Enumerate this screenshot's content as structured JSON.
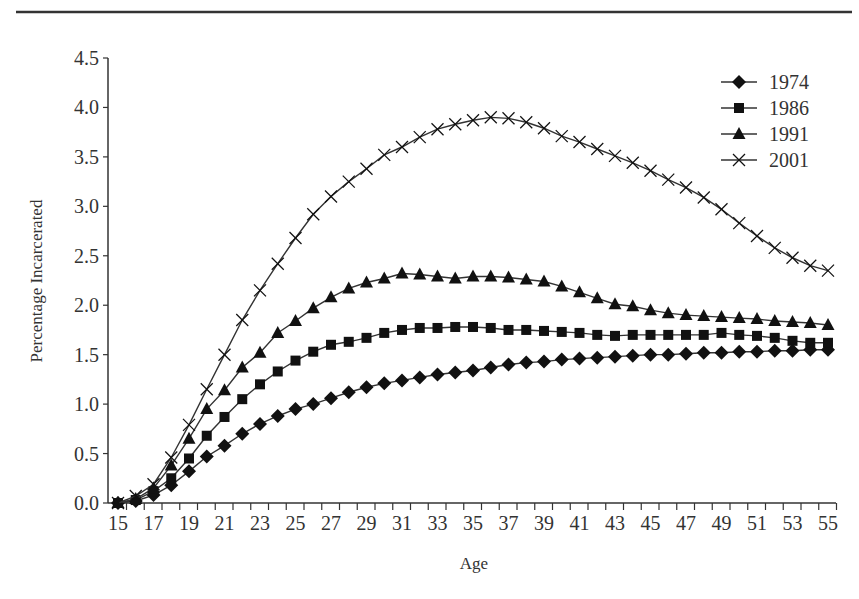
{
  "chart_data": {
    "type": "line",
    "title": "",
    "xlabel": "Age",
    "ylabel": "Percentage Incarcerated",
    "ylim": [
      0,
      4.5
    ],
    "xlim": [
      15,
      55
    ],
    "y_ticks": [
      "0.0",
      "0.5",
      "1.0",
      "1.5",
      "2.0",
      "2.5",
      "3.0",
      "3.5",
      "4.0",
      "4.5"
    ],
    "x_tick_labels": [
      "15",
      "17",
      "19",
      "21",
      "23",
      "25",
      "27",
      "29",
      "31",
      "33",
      "35",
      "37",
      "39",
      "41",
      "43",
      "45",
      "47",
      "49",
      "51",
      "53",
      "55"
    ],
    "grid": false,
    "legend_position": "top-right",
    "x": [
      15,
      16,
      17,
      18,
      19,
      20,
      21,
      22,
      23,
      24,
      25,
      26,
      27,
      28,
      29,
      30,
      31,
      32,
      33,
      34,
      35,
      36,
      37,
      38,
      39,
      40,
      41,
      42,
      43,
      44,
      45,
      46,
      47,
      48,
      49,
      50,
      51,
      52,
      53,
      54,
      55
    ],
    "series": [
      {
        "name": "1974",
        "marker": "diamond",
        "values": [
          0.0,
          0.02,
          0.08,
          0.18,
          0.32,
          0.47,
          0.58,
          0.7,
          0.8,
          0.88,
          0.95,
          1.0,
          1.06,
          1.12,
          1.17,
          1.21,
          1.24,
          1.27,
          1.3,
          1.32,
          1.34,
          1.37,
          1.4,
          1.42,
          1.43,
          1.45,
          1.46,
          1.47,
          1.48,
          1.49,
          1.5,
          1.5,
          1.51,
          1.52,
          1.52,
          1.53,
          1.53,
          1.54,
          1.54,
          1.55,
          1.55
        ]
      },
      {
        "name": "1986",
        "marker": "square",
        "values": [
          0.0,
          0.03,
          0.12,
          0.25,
          0.45,
          0.68,
          0.87,
          1.05,
          1.2,
          1.33,
          1.44,
          1.53,
          1.6,
          1.63,
          1.67,
          1.72,
          1.75,
          1.77,
          1.77,
          1.78,
          1.78,
          1.77,
          1.75,
          1.75,
          1.74,
          1.73,
          1.72,
          1.7,
          1.69,
          1.7,
          1.7,
          1.7,
          1.7,
          1.7,
          1.72,
          1.7,
          1.69,
          1.67,
          1.64,
          1.62,
          1.62
        ]
      },
      {
        "name": "1991",
        "marker": "triangle",
        "values": [
          0.0,
          0.04,
          0.15,
          0.38,
          0.65,
          0.95,
          1.14,
          1.37,
          1.52,
          1.72,
          1.84,
          1.97,
          2.08,
          2.17,
          2.23,
          2.27,
          2.32,
          2.31,
          2.29,
          2.27,
          2.29,
          2.29,
          2.28,
          2.26,
          2.24,
          2.19,
          2.13,
          2.07,
          2.01,
          1.99,
          1.95,
          1.92,
          1.9,
          1.89,
          1.88,
          1.87,
          1.86,
          1.84,
          1.83,
          1.82,
          1.8
        ]
      },
      {
        "name": "2001",
        "marker": "x",
        "values": [
          0.0,
          0.07,
          0.19,
          0.46,
          0.79,
          1.15,
          1.5,
          1.85,
          2.15,
          2.42,
          2.68,
          2.92,
          3.1,
          3.25,
          3.38,
          3.52,
          3.6,
          3.7,
          3.78,
          3.83,
          3.87,
          3.9,
          3.89,
          3.85,
          3.79,
          3.71,
          3.65,
          3.58,
          3.51,
          3.44,
          3.36,
          3.27,
          3.19,
          3.09,
          2.97,
          2.83,
          2.7,
          2.58,
          2.48,
          2.4,
          2.35
        ]
      }
    ]
  },
  "colors": {
    "line": "#333333",
    "marker": "#111111",
    "axis": "#333333"
  }
}
